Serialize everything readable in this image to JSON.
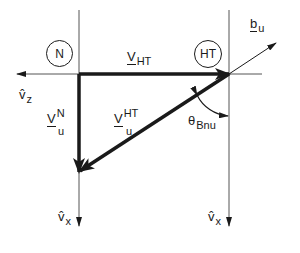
{
  "diagram": {
    "frames": {
      "left": "N",
      "right": "HT"
    },
    "vectors": {
      "v_ht": {
        "main": "V",
        "sub": "HT"
      },
      "vn_u": {
        "main": "V",
        "sup": "N",
        "sub": "u"
      },
      "vht_u": {
        "main": "V",
        "sup": "HT",
        "sub": "u"
      },
      "b_u": {
        "main": "b",
        "sub": "u"
      }
    },
    "axes": {
      "vz": {
        "main": "v̂",
        "sub": "z"
      },
      "vx_left": {
        "main": "v̂",
        "sub": "x"
      },
      "vx_right": {
        "main": "v̂",
        "sub": "x"
      }
    },
    "angle": {
      "main": "θ",
      "sub": "Bnu"
    },
    "colors": {
      "ink": "#1a1a1a",
      "thin": "#555555",
      "background": "#ffffff"
    }
  }
}
